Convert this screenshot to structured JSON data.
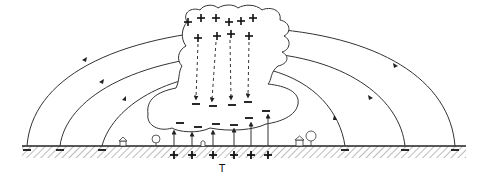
{
  "diagram": {
    "type": "thundercloud-electric-field",
    "ground_label": "T",
    "cloud_top_charges": "+",
    "cloud_bottom_charges": "−",
    "ground_charges_under_cloud": "+",
    "ground_charges_far": "−",
    "top_plus_count": 10,
    "cloud_minus_count": 11,
    "ground_plus_count": 6,
    "ground_minus_count": 6,
    "arc_count": 6,
    "colors": {
      "ink": "#222222",
      "background": "#ffffff"
    }
  }
}
